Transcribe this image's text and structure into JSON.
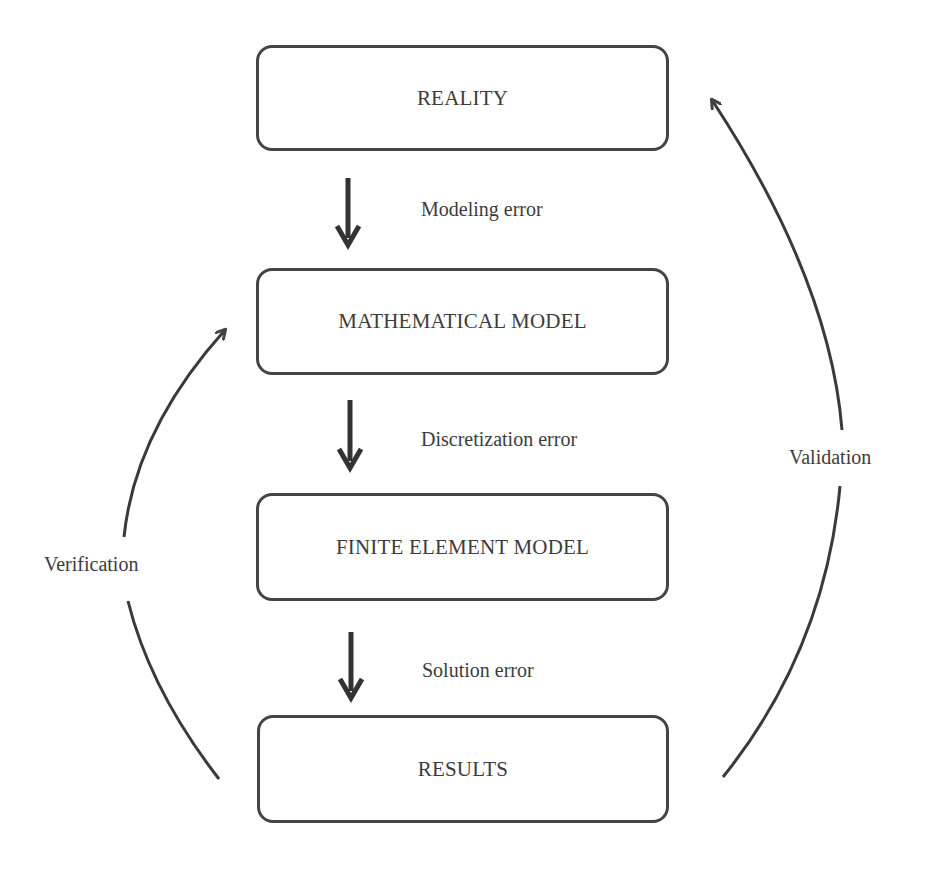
{
  "diagram": {
    "boxes": [
      {
        "id": "reality",
        "label": "REALITY"
      },
      {
        "id": "mathematical-model",
        "label": "MATHEMATICAL MODEL"
      },
      {
        "id": "finite-element-model",
        "label": "FINITE ELEMENT MODEL"
      },
      {
        "id": "results",
        "label": "RESULTS"
      }
    ],
    "errors": [
      {
        "label": "Modeling error"
      },
      {
        "label": "Discretization error"
      },
      {
        "label": "Solution error"
      }
    ],
    "loops": {
      "verification": {
        "label": "Verification",
        "from": "RESULTS",
        "to": "MATHEMATICAL MODEL"
      },
      "validation": {
        "label": "Validation",
        "from": "RESULTS",
        "to": "REALITY"
      }
    },
    "colors": {
      "stroke": "#444444",
      "text": "#3c3c3c",
      "background": "#ffffff"
    }
  }
}
